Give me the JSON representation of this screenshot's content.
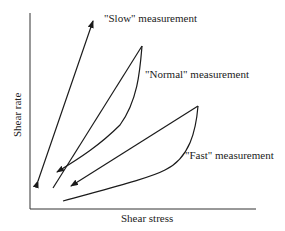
{
  "diagram": {
    "x_axis_label": "Shear stress",
    "y_axis_label": "Shear rate",
    "curves": [
      {
        "name": "slow",
        "label": "\"Slow\" measurement"
      },
      {
        "name": "normal",
        "label": "\"Normal\" measurement"
      },
      {
        "name": "fast",
        "label": "\"Fast\" measurement"
      }
    ],
    "colors": {
      "line": "#1a1a1a",
      "axis": "#333333",
      "text": "#222222"
    }
  }
}
